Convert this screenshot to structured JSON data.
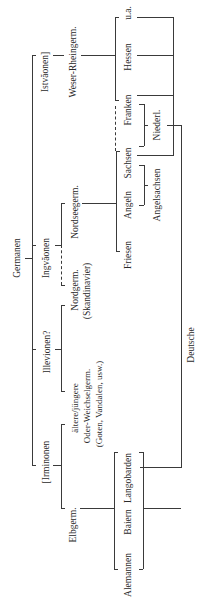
{
  "diagram": {
    "root": "Germanen",
    "groups": {
      "istvaeonen": "Istvăonen]",
      "ingvaeonen": "Ingvăonen",
      "illevionen": "Illevionen?",
      "irminonen": "[Irminonen"
    },
    "branches": {
      "weser_rhein": "Weser-Rheingerm.",
      "nordsee": "Nordseegerm.",
      "nordgerm_line1": "Nordgerm.",
      "nordgerm_line2": "(Skandinavier)",
      "oder_line1": "ältere/jüngere",
      "oder_line2": "Oder-Weichselgerm.",
      "oder_line3": "(Goten, Vandalen, usw.)",
      "elbgerm": "Elbgerm."
    },
    "tribes": {
      "ua": "u.a.",
      "hessen": "Hessen",
      "franken": "Franken",
      "sachsen": "Sachsen",
      "angeln": "Angeln",
      "friesen": "Friesen",
      "langobarden": "Langobarden",
      "baiern": "Baiern",
      "alemannen": "Alemannen"
    },
    "derived": {
      "niederl": "Niederl.",
      "angelsachsen": "Angelsachsen",
      "deutsche": "Deutsche"
    }
  }
}
